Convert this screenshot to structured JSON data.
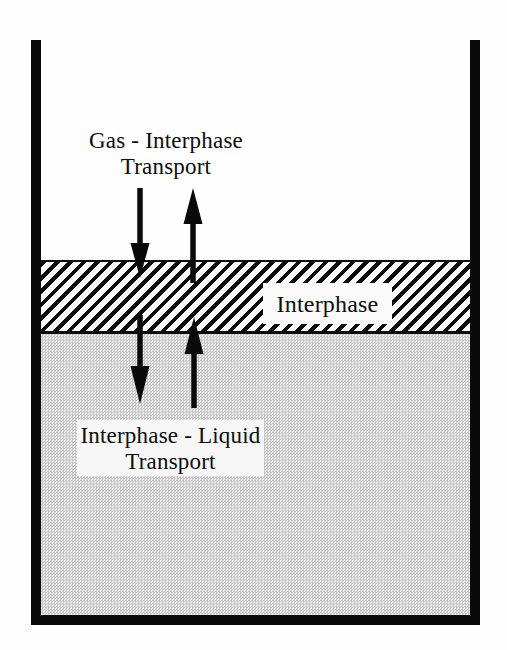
{
  "labels": {
    "gas_transport": {
      "line1": "Gas - Interphase",
      "line2": "Transport"
    },
    "interphase": "Interphase",
    "liquid_transport": {
      "line1": "Interphase - Liquid",
      "line2": "Transport"
    }
  },
  "regions": {
    "gas": "gas headspace",
    "interphase": "hatched interphase film",
    "liquid": "stippled liquid bulk"
  },
  "colors": {
    "ink": "#0a0a0a",
    "background": "#fefefe",
    "liquid_checker_dark": "#c6c6c6",
    "liquid_checker_light": "#ebebeb",
    "label_box": "#fafafa"
  }
}
